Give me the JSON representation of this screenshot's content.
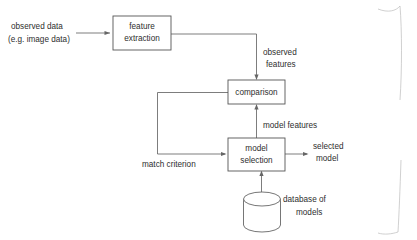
{
  "diagram": {
    "type": "flowchart",
    "background_color": "#ffffff",
    "stroke_color": "#666666",
    "text_color": "#2e2e2e",
    "nodes": [
      {
        "id": "feature_extraction",
        "shape": "rectangle",
        "line1": "feature",
        "line2": "extraction"
      },
      {
        "id": "comparison",
        "shape": "rectangle",
        "line1": "comparison",
        "line2": ""
      },
      {
        "id": "model_selection",
        "shape": "rectangle",
        "line1": "model",
        "line2": "selection"
      },
      {
        "id": "model_database",
        "shape": "cylinder",
        "line1": "",
        "line2": ""
      }
    ],
    "labels": {
      "observed_data_line1": "observed data",
      "observed_data_line2": "(e.g. image data)",
      "observed_features_line1": "observed",
      "observed_features_line2": "features",
      "model_features": "model features",
      "match_criterion": "match criterion",
      "selected_model_line1": "selected",
      "selected_model_line2": "model",
      "database_of_models_line1": "database of",
      "database_of_models_line2": "models"
    }
  }
}
